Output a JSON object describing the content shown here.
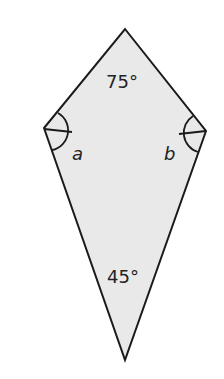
{
  "diagram": {
    "shape": "kite",
    "fill_color": "#e9e9e9",
    "stroke_color": "#1a1a1a",
    "vertices": {
      "top": [
        125,
        29
      ],
      "left": [
        44,
        128
      ],
      "right": [
        206,
        131
      ],
      "bottom": [
        125,
        360
      ]
    },
    "labels": {
      "top_angle": "75°",
      "bottom_angle": "45°",
      "left_angle": "a",
      "right_angle": "b"
    }
  }
}
